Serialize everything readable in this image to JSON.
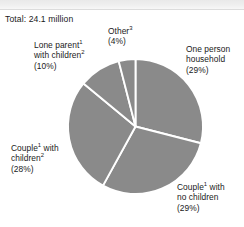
{
  "figure": {
    "total_label": "Total: 24.1 million"
  },
  "chart_data": {
    "type": "pie",
    "title": "",
    "subtitle": "",
    "xlabel": "",
    "ylabel": "",
    "total": "24.1 million",
    "units": "million households",
    "grid": false,
    "legend_position": "callout-labels",
    "start_angle_deg": 0,
    "direction": "clockwise",
    "slice_color": "#8a8a8a",
    "separator_color": "#ffffff",
    "categories": [
      "One person household",
      "Couple with no children",
      "Couple with children",
      "Lone parent with children",
      "Other"
    ],
    "values": [
      29,
      29,
      28,
      10,
      4
    ],
    "slices": [
      {
        "name": "one-person-household",
        "line1": "One person",
        "line2": "household",
        "sup1": "",
        "sup2": "",
        "percent": "(29%)",
        "value": 29,
        "start_deg": 0,
        "end_deg": 104.4
      },
      {
        "name": "couple-no-children",
        "line1": "Couple",
        "line2": "no children",
        "sup1": "1",
        "sup2": "",
        "percent": "(29%)",
        "value": 29,
        "start_deg": 104.4,
        "end_deg": 208.8
      },
      {
        "name": "couple-with-children",
        "line1": "Couple",
        "line2": "children",
        "sup1": "1",
        "sup2": "2",
        "percent": "(28%)",
        "value": 28,
        "start_deg": 208.8,
        "end_deg": 309.6
      },
      {
        "name": "lone-parent-with-children",
        "line1": "Lone parent",
        "line2": "children",
        "sup1": "1",
        "sup2": "2",
        "percent": "(10%)",
        "value": 10,
        "start_deg": 309.6,
        "end_deg": 345.6
      },
      {
        "name": "other",
        "line1": "Other",
        "line2": "",
        "sup1": "3",
        "sup2": "",
        "percent": "(4%)",
        "value": 4,
        "start_deg": 345.6,
        "end_deg": 360
      }
    ]
  },
  "labels": {
    "other": {
      "text": "Other",
      "sup": "3",
      "percent": "(4%)"
    },
    "lone_parent": {
      "line1_a": "Lone parent",
      "line1_sup": "1",
      "line2_a": "with children",
      "line2_sup": "2",
      "percent": "(10%)"
    },
    "one_person": {
      "line1": "One person",
      "line2": "household",
      "percent": "(29%)"
    },
    "couple_children": {
      "line1_a": "Couple",
      "line1_sup": "1",
      "line1_b": " with",
      "line2_a": "children",
      "line2_sup": "2",
      "percent": "(28%)"
    },
    "couple_no_children": {
      "line1_a": "Couple",
      "line1_sup": "1",
      "line1_b": " with",
      "line2": "no children",
      "percent": "(29%)"
    }
  }
}
